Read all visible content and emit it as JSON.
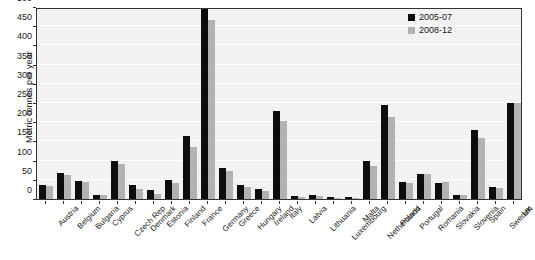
{
  "chart_data": {
    "type": "bar",
    "title": "",
    "xlabel": "",
    "ylabel": "Metric tonnes per year",
    "ylim": [
      0,
      500
    ],
    "ytick_step": 50,
    "yticks": [
      0,
      50,
      100,
      150,
      200,
      250,
      300,
      350,
      400,
      450,
      500
    ],
    "grid": true,
    "legend_position": "top-right",
    "colors": {
      "series_2005_07": "#0d0d0d",
      "series_2008_12": "#b2b2b2",
      "plot_background": "#f2f2f2",
      "gridline": "#ffffff",
      "axis": "#333333"
    },
    "categories": [
      "Austria",
      "Belgium",
      "Bulgaria",
      "Cyprus",
      "Czech Rep",
      "Denmark",
      "Estonia",
      "Finland",
      "France",
      "Germany",
      "Greece",
      "Hungary",
      "Ireland",
      "Italy",
      "Latvia",
      "Lithuania",
      "Luxembourg",
      "Malta",
      "Netherlands",
      "Poland",
      "Portugal",
      "Romania",
      "Slovakia",
      "Slovenia",
      "Spain",
      "Sweden",
      "UK"
    ],
    "series": [
      {
        "name": "2005-07",
        "color": "#0d0d0d",
        "values": [
          36,
          67,
          47,
          10,
          100,
          36,
          24,
          50,
          163,
          512,
          80,
          37,
          27,
          229,
          7,
          11,
          4,
          5,
          100,
          245,
          45,
          66,
          41,
          10,
          181,
          32,
          250
        ]
      },
      {
        "name": "2008-12",
        "color": "#b2b2b2",
        "values": [
          33,
          62,
          45,
          10,
          92,
          25,
          13,
          43,
          135,
          465,
          74,
          30,
          22,
          202,
          5,
          9,
          3,
          3,
          85,
          213,
          43,
          66,
          44,
          11,
          159,
          28,
          250
        ]
      }
    ]
  },
  "legend": {
    "items": [
      {
        "label": "2005-07"
      },
      {
        "label": "2008-12"
      }
    ]
  },
  "axes": {
    "y_title": "Metric tonnes per year"
  }
}
